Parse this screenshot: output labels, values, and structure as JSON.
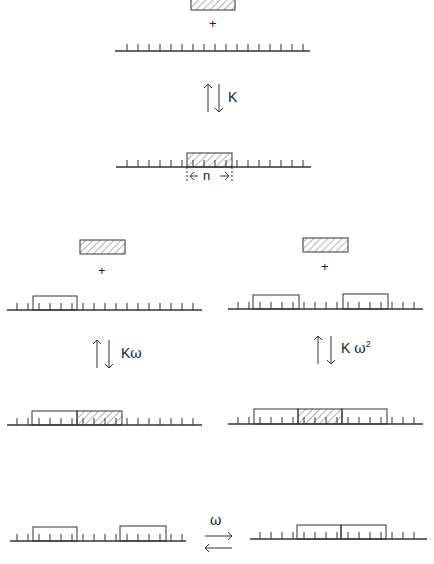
{
  "diagram": {
    "title": "",
    "top_scheme": {
      "plus": "+",
      "rate_label": "K",
      "site_size_label": "n"
    },
    "left_scheme": {
      "plus": "+",
      "rate_label_base": "K",
      "rate_label_factor": "ω"
    },
    "right_scheme": {
      "plus": "+",
      "rate_label_base": "K",
      "rate_label_factor": "ω",
      "rate_label_exponent": "2"
    },
    "bottom_equilibrium": {
      "forward_label": "ω"
    }
  },
  "colors": {
    "ink": "#333333",
    "hatch": "#555555",
    "background": "#ffffff"
  }
}
